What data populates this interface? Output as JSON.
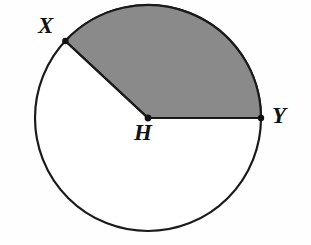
{
  "figure": {
    "background_color": "#fefefe",
    "width": 311,
    "height": 245
  },
  "circle": {
    "name": "circle-H",
    "center_x": 148,
    "center_y": 118,
    "radius": 113,
    "stroke_color": "#1a1a1a",
    "stroke_width": 2.2,
    "fill_color": "#ffffff"
  },
  "sector": {
    "name": "shaded-sector-XHY",
    "fill_color": "#8a8a8a",
    "stroke_color": "#1a1a1a",
    "stroke_width": 2.2,
    "start_angle_deg": 0,
    "end_angle_deg": 137,
    "description": "Shaded region bounded by radius HY, arc from Y to X, and radius HX"
  },
  "points": [
    {
      "id": "X",
      "label": "X",
      "x": 65,
      "y": 41,
      "angle_deg": 137,
      "label_x": 38,
      "label_y": 14,
      "dot_radius": 3.2,
      "on_circle": true
    },
    {
      "id": "Y",
      "label": "Y",
      "x": 261,
      "y": 118,
      "angle_deg": 0,
      "label_x": 272,
      "label_y": 104,
      "dot_radius": 3.2,
      "on_circle": true
    },
    {
      "id": "H",
      "label": "H",
      "x": 148,
      "y": 118,
      "angle_deg": null,
      "label_x": 134,
      "label_y": 121,
      "dot_radius": 3.4,
      "on_circle": false
    }
  ],
  "radii": [
    {
      "name": "radius-HX",
      "from": "H",
      "to": "X",
      "stroke_color": "#1a1a1a",
      "stroke_width": 2.2
    },
    {
      "name": "radius-HY",
      "from": "H",
      "to": "Y",
      "stroke_color": "#1a1a1a",
      "stroke_width": 2.2
    }
  ],
  "colors": {
    "ink": "#1a1a1a",
    "shade": "#8a8a8a",
    "paper": "#fefefe"
  }
}
